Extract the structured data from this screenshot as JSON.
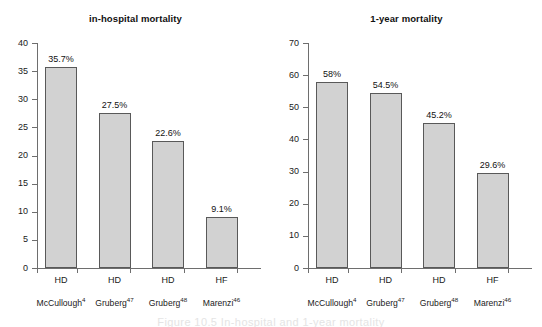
{
  "figure": {
    "caption_partial": "Figure 10.5   In-hospital and 1-year mortality"
  },
  "panels": [
    {
      "key": "in_hospital",
      "title": "in-hospital mortality"
    },
    {
      "key": "one_year",
      "title": "1-year mortality"
    }
  ],
  "chart_data": [
    {
      "type": "bar",
      "title": "in-hospital mortality",
      "xlabel": "",
      "ylabel": "",
      "ylim": [
        0,
        40
      ],
      "yticks": [
        0,
        5,
        10,
        15,
        20,
        25,
        30,
        35,
        40
      ],
      "ytick_labels": [
        "0",
        "5",
        "10",
        "15",
        "20",
        "25",
        "30",
        "35",
        "40"
      ],
      "grid": false,
      "legend": "none",
      "categories": [
        "McCullough4",
        "Gruberg47",
        "Gruberg48",
        "Marenzi46"
      ],
      "category_labels": [
        "McCullough",
        "Gruberg",
        "Gruberg",
        "Marenzi"
      ],
      "category_refs": [
        "4",
        "47",
        "48",
        "46"
      ],
      "modalities": [
        "HD",
        "HD",
        "HD",
        "HF"
      ],
      "values": [
        35.7,
        27.5,
        22.6,
        9.1
      ],
      "data_labels": [
        "35.7%",
        "27.5%",
        "22.6%",
        "9.1%"
      ],
      "bar_fill": "#d2d2d2",
      "bar_edge": "#595959"
    },
    {
      "type": "bar",
      "title": "1-year mortality",
      "xlabel": "",
      "ylabel": "",
      "ylim": [
        0,
        70
      ],
      "yticks": [
        0,
        10,
        20,
        30,
        40,
        50,
        60,
        70
      ],
      "ytick_labels": [
        "0",
        "10",
        "20",
        "30",
        "40",
        "50",
        "60",
        "70"
      ],
      "grid": false,
      "legend": "none",
      "categories": [
        "McCullough4",
        "Gruberg47",
        "Gruberg48",
        "Marenzi46"
      ],
      "category_labels": [
        "McCullough",
        "Gruberg",
        "Gruberg",
        "Marenzi"
      ],
      "category_refs": [
        "4",
        "47",
        "48",
        "46"
      ],
      "modalities": [
        "HD",
        "HD",
        "HD",
        "HF"
      ],
      "values": [
        58,
        54.5,
        45.2,
        29.6
      ],
      "data_labels": [
        "58%",
        "54.5%",
        "45.2%",
        "29.6%"
      ],
      "bar_fill": "#d2d2d2",
      "bar_edge": "#595959"
    }
  ]
}
